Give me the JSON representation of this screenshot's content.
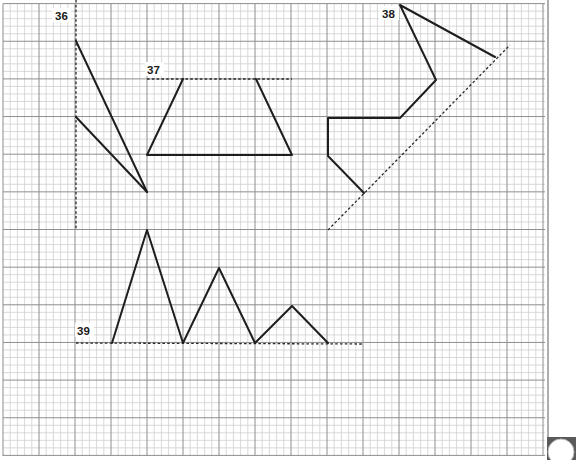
{
  "sheet": {
    "grid": {
      "left": 3,
      "top": 3.6,
      "right": 545,
      "bottom": 456,
      "minor_x": 7.2,
      "minor_y": 7.53,
      "major_every": 5,
      "minor_color": "#cfcfcf",
      "major_color": "#8e8e8e",
      "border_right_x": 548
    },
    "corner_tab": {
      "color": "#5a5a5a",
      "circle_color": "#ffffff"
    }
  },
  "figures": [
    {
      "id": "36",
      "label": "36",
      "label_pos": [
        55,
        20
      ],
      "dashed": [
        [
          [
            76,
            0
          ],
          [
            76,
            230
          ]
        ]
      ],
      "polylines": [
        [
          [
            76,
            41
          ],
          [
            147,
            192
          ]
        ],
        [
          [
            76,
            117
          ],
          [
            147,
            192
          ]
        ]
      ]
    },
    {
      "id": "37",
      "label": "37",
      "label_pos": [
        147,
        74
      ],
      "dashed": [
        [
          [
            147,
            79
          ],
          [
            292,
            79
          ]
        ]
      ],
      "polylines": [
        [
          [
            183,
            79
          ],
          [
            147,
            155
          ],
          [
            292,
            155
          ],
          [
            256,
            79
          ]
        ]
      ]
    },
    {
      "id": "38",
      "label": "38",
      "label_pos": [
        382,
        18
      ],
      "dashed": [
        [
          [
            328,
            230
          ],
          [
            510,
            45
          ]
        ]
      ],
      "polylines": [
        [
          [
            495,
            57
          ],
          [
            400,
            5
          ],
          [
            436,
            80
          ],
          [
            400,
            118
          ],
          [
            328,
            118
          ],
          [
            328,
            156
          ],
          [
            364,
            193
          ]
        ]
      ]
    },
    {
      "id": "39",
      "label": "39",
      "label_pos": [
        77,
        335
      ],
      "dashed": [
        [
          [
            76,
            343
          ],
          [
            362,
            344
          ]
        ]
      ],
      "polylines": [
        [
          [
            112,
            343
          ],
          [
            147,
            230
          ],
          [
            183,
            343
          ],
          [
            219,
            268
          ],
          [
            255,
            343
          ],
          [
            292,
            306
          ],
          [
            328,
            343
          ]
        ]
      ]
    }
  ]
}
